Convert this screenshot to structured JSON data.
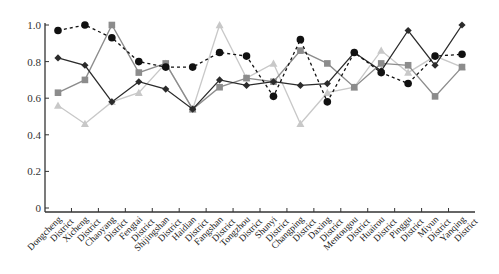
{
  "chart_data": {
    "type": "line",
    "title": "",
    "xlabel": "",
    "ylabel": "",
    "ylim": [
      0,
      1.0
    ],
    "yticks": [
      "0",
      "0.2",
      "0.4",
      "0.6",
      "0.8",
      "1.0"
    ],
    "grid": false,
    "legend": "none",
    "categories": [
      [
        "Dongcheng",
        "District"
      ],
      [
        "Xicheng",
        "District"
      ],
      [
        "Chaoyang",
        "District"
      ],
      [
        "Fengtai",
        "District"
      ],
      [
        "Shijingshan",
        "District"
      ],
      [
        "Haidian",
        "District"
      ],
      [
        "Fangshan",
        "District"
      ],
      [
        "Tongzhou",
        "District"
      ],
      [
        "Shunyi",
        "District"
      ],
      [
        "Changping",
        "District"
      ],
      [
        "Daxing",
        "District"
      ],
      [
        "Mentougou",
        "District"
      ],
      [
        "Huairou",
        "District"
      ],
      [
        "Pinggu",
        "District"
      ],
      [
        "Miyun",
        "District"
      ],
      [
        "Yanqing",
        "District"
      ]
    ],
    "series": [
      {
        "name": "series-diamond",
        "marker": "diamond",
        "line": "solid",
        "color": "#2b2b2b",
        "values": [
          0.82,
          0.78,
          0.58,
          0.69,
          0.65,
          0.54,
          0.7,
          0.67,
          0.69,
          0.67,
          0.68,
          0.85,
          0.75,
          0.97,
          0.78,
          1.0
        ]
      },
      {
        "name": "series-circle",
        "marker": "circle",
        "line": "dashed",
        "color": "#111111",
        "values": [
          0.97,
          1.0,
          0.93,
          0.8,
          0.77,
          0.77,
          0.85,
          0.83,
          0.61,
          0.92,
          0.58,
          0.85,
          0.74,
          0.68,
          0.83,
          0.84
        ]
      },
      {
        "name": "series-square",
        "marker": "square",
        "line": "solid",
        "color": "#8c8c8c",
        "values": [
          0.63,
          0.7,
          1.0,
          0.74,
          0.79,
          0.54,
          0.66,
          0.71,
          0.69,
          0.86,
          0.79,
          0.66,
          0.79,
          0.78,
          0.61,
          0.77
        ]
      },
      {
        "name": "series-triangle",
        "marker": "triangle",
        "line": "solid",
        "color": "#c8c8c8",
        "values": [
          0.56,
          0.46,
          0.58,
          0.63,
          0.79,
          0.54,
          1.0,
          0.71,
          0.79,
          0.46,
          0.63,
          0.66,
          0.86,
          0.74,
          0.83,
          0.77
        ]
      }
    ]
  }
}
